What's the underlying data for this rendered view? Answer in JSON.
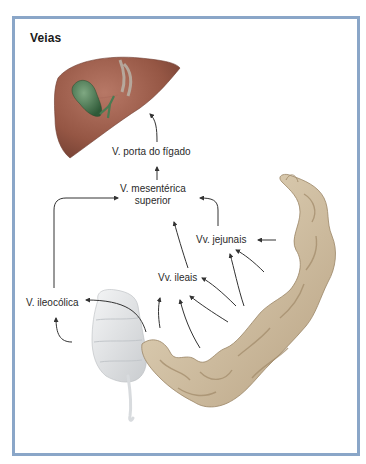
{
  "figure": {
    "title": "Veias",
    "frame_color": "#8aa6c8"
  },
  "labels": {
    "portal_vein": "V. porta do fígado",
    "smv_line1": "V. mesentérica",
    "smv_line2": "superior",
    "jejunal": "Vv. jejunais",
    "ileal": "Vv. ileais",
    "ileocolic": "V. ileocólica"
  },
  "organs": {
    "liver": "liver",
    "gallbladder": "gallbladder",
    "cecum_colon": "cecum-ascending-colon",
    "small_intestine": "small-intestine"
  },
  "colors": {
    "liver": "#9a5a4a",
    "gallbladder": "#4a7a52",
    "intestine": "#d8c6a6",
    "colon": "#e4e6e8",
    "arrow": "#333333"
  },
  "flow": [
    {
      "from": "Vv. jejunais",
      "to": "V. mesentérica superior"
    },
    {
      "from": "Vv. ileais",
      "to": "V. mesentérica superior"
    },
    {
      "from": "V. ileocólica",
      "to": "V. mesentérica superior"
    },
    {
      "from": "V. mesentérica superior",
      "to": "V. porta do fígado"
    },
    {
      "from": "V. porta do fígado",
      "to": "Fígado"
    }
  ]
}
